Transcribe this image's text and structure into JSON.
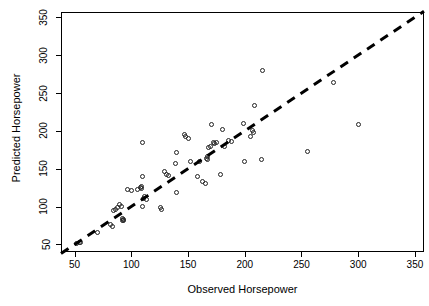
{
  "chart_data": {
    "type": "scatter",
    "title": "",
    "xlabel": "Observed Horsepower",
    "ylabel": "Predicted Horsepower",
    "xlim": [
      38,
      358
    ],
    "ylim": [
      40,
      357
    ],
    "xticks": [
      50,
      100,
      150,
      200,
      250,
      300,
      350
    ],
    "yticks": [
      50,
      100,
      150,
      200,
      250,
      300,
      350
    ],
    "xtick_labels": [
      "50",
      "100",
      "150",
      "200",
      "250",
      "300",
      "350"
    ],
    "ytick_labels": [
      "50",
      "100",
      "150",
      "200",
      "250",
      "300",
      "350"
    ],
    "grid": false,
    "legend": "none",
    "marker": "open-circle",
    "marker_color": "#222222",
    "reference_line": {
      "style": "dashed",
      "color": "#000000",
      "width": 3,
      "description": "y = x identity line",
      "x_start": 38,
      "y_start": 38,
      "x_end": 358,
      "y_end": 358
    },
    "points": [
      {
        "x": 52,
        "y": 51
      },
      {
        "x": 54,
        "y": 53
      },
      {
        "x": 55,
        "y": 52
      },
      {
        "x": 70,
        "y": 66
      },
      {
        "x": 82,
        "y": 76
      },
      {
        "x": 83,
        "y": 74
      },
      {
        "x": 84,
        "y": 95
      },
      {
        "x": 86,
        "y": 96
      },
      {
        "x": 88,
        "y": 99
      },
      {
        "x": 90,
        "y": 103
      },
      {
        "x": 91,
        "y": 100
      },
      {
        "x": 92,
        "y": 84
      },
      {
        "x": 92,
        "y": 82
      },
      {
        "x": 93,
        "y": 83
      },
      {
        "x": 93,
        "y": 81
      },
      {
        "x": 97,
        "y": 122
      },
      {
        "x": 100,
        "y": 121
      },
      {
        "x": 105,
        "y": 123
      },
      {
        "x": 108,
        "y": 125
      },
      {
        "x": 109,
        "y": 126
      },
      {
        "x": 109,
        "y": 124
      },
      {
        "x": 110,
        "y": 140
      },
      {
        "x": 110,
        "y": 184
      },
      {
        "x": 110,
        "y": 100
      },
      {
        "x": 111,
        "y": 111
      },
      {
        "x": 112,
        "y": 113
      },
      {
        "x": 113,
        "y": 110
      },
      {
        "x": 126,
        "y": 99
      },
      {
        "x": 127,
        "y": 96
      },
      {
        "x": 129,
        "y": 146
      },
      {
        "x": 131,
        "y": 143
      },
      {
        "x": 133,
        "y": 141
      },
      {
        "x": 139,
        "y": 157
      },
      {
        "x": 140,
        "y": 171
      },
      {
        "x": 140,
        "y": 118
      },
      {
        "x": 147,
        "y": 195
      },
      {
        "x": 148,
        "y": 192
      },
      {
        "x": 150,
        "y": 190
      },
      {
        "x": 152,
        "y": 160
      },
      {
        "x": 158,
        "y": 140
      },
      {
        "x": 160,
        "y": 160
      },
      {
        "x": 163,
        "y": 133
      },
      {
        "x": 165,
        "y": 131
      },
      {
        "x": 166,
        "y": 164
      },
      {
        "x": 167,
        "y": 166
      },
      {
        "x": 167,
        "y": 162
      },
      {
        "x": 168,
        "y": 178
      },
      {
        "x": 170,
        "y": 180
      },
      {
        "x": 171,
        "y": 208
      },
      {
        "x": 172,
        "y": 184
      },
      {
        "x": 173,
        "y": 183
      },
      {
        "x": 175,
        "y": 185
      },
      {
        "x": 179,
        "y": 143
      },
      {
        "x": 180,
        "y": 202
      },
      {
        "x": 182,
        "y": 180
      },
      {
        "x": 186,
        "y": 187
      },
      {
        "x": 188,
        "y": 186
      },
      {
        "x": 199,
        "y": 210
      },
      {
        "x": 200,
        "y": 159
      },
      {
        "x": 205,
        "y": 192
      },
      {
        "x": 207,
        "y": 200
      },
      {
        "x": 208,
        "y": 198
      },
      {
        "x": 209,
        "y": 233
      },
      {
        "x": 215,
        "y": 162
      },
      {
        "x": 216,
        "y": 280
      },
      {
        "x": 255,
        "y": 173
      },
      {
        "x": 278,
        "y": 264
      },
      {
        "x": 300,
        "y": 209
      }
    ]
  }
}
